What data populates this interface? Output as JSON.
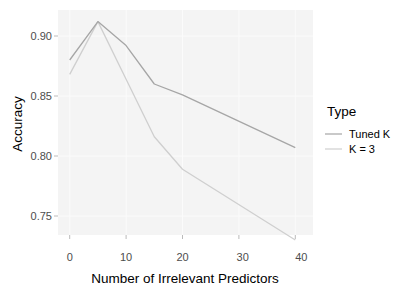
{
  "chart_data": {
    "type": "line",
    "title": "",
    "xlabel": "Number of Irrelevant Predictors",
    "ylabel": "Accuracy",
    "x": [
      0,
      5,
      10,
      15,
      20,
      40
    ],
    "series": [
      {
        "name": "Tuned K",
        "color": "#a6a6a6",
        "values": [
          0.88,
          0.912,
          0.892,
          0.86,
          0.851,
          0.807
        ]
      },
      {
        "name": "K = 3",
        "color": "#cfcfcf",
        "values": [
          0.868,
          0.912,
          0.864,
          0.816,
          0.789,
          0.73
        ]
      }
    ],
    "xlim": [
      -2,
      42
    ],
    "ylim": [
      0.722,
      0.921
    ],
    "x_ticks": [
      0,
      10,
      20,
      30,
      40
    ],
    "y_ticks": [
      0.75,
      0.8,
      0.85,
      0.9
    ],
    "x_tick_labels": [
      "0",
      "10",
      "20",
      "30",
      "40"
    ],
    "y_tick_labels": [
      "0.75",
      "0.80",
      "0.85",
      "0.90"
    ],
    "grid": true,
    "legend": {
      "title": "Type",
      "position": "right",
      "entries": [
        "Tuned K",
        "K = 3"
      ]
    }
  },
  "labels": {
    "xlabel": "Number of Irrelevant Predictors",
    "ylabel": "Accuracy",
    "legend_title": "Type",
    "legend_items": [
      "Tuned K",
      "K = 3"
    ],
    "x_ticks": [
      "0",
      "10",
      "20",
      "30",
      "40"
    ],
    "y_ticks": [
      "0.75",
      "0.80",
      "0.85",
      "0.90"
    ]
  }
}
